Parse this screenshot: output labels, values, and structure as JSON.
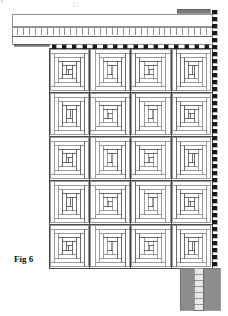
{
  "figure": {
    "label": "Fig 6",
    "type": "patent-line-drawing",
    "caption_top_faint": "",
    "background": "#ffffff",
    "line_color": "#4a4a4a",
    "fill_color": "#ffffff",
    "shade_color": "#999999",
    "dark_color": "#1a1a1a",
    "grey_block_color": "#8d8d8d"
  },
  "header_rail": {
    "name": "top-header-rail",
    "x": 12,
    "y": 14,
    "width": 200,
    "height": 30,
    "top_band": {
      "x": 12,
      "y": 14,
      "width": 200,
      "height": 12
    },
    "comb_band": {
      "x": 12,
      "y": 27,
      "width": 200,
      "height": 9,
      "teeth": 34
    },
    "bottom_band": {
      "x": 12,
      "y": 36,
      "width": 200,
      "height": 8
    }
  },
  "accent_bars": [
    {
      "name": "top-right-grey-bar",
      "x": 177,
      "y": 9,
      "width": 33,
      "height": 4,
      "color": "#7c7c7c"
    },
    {
      "name": "left-grey-bar",
      "x": 14,
      "y": 42,
      "width": 35,
      "height": 4,
      "color": "#7c7c7c"
    }
  ],
  "grid": {
    "name": "panel-grid",
    "x": 49,
    "y": 48,
    "width": 163,
    "height": 220,
    "columns": 4,
    "rows": 5,
    "cell_width": 40.75,
    "cell_height": 44,
    "pattern": "log-cabin-spiral"
  },
  "top_connectors": {
    "name": "top-connector-tabs",
    "count": 16,
    "y": 48,
    "height": 4,
    "width": 4,
    "color": "#1a1a1a"
  },
  "right_edge": {
    "name": "dashed-right-edge",
    "x": 212,
    "y_start": 10,
    "y_end": 272,
    "dash_height": 4,
    "dash_gap": 3,
    "dash_width": 5,
    "color": "#1a1a1a"
  },
  "bottom_block": {
    "name": "bottom-right-shaded-block",
    "x": 180,
    "y": 268,
    "width": 40,
    "height": 42,
    "color": "#8d8d8d",
    "ladder": {
      "x": 194,
      "y": 268,
      "width": 9,
      "height": 42,
      "rungs": 7,
      "color": "#e8e8e8"
    }
  }
}
